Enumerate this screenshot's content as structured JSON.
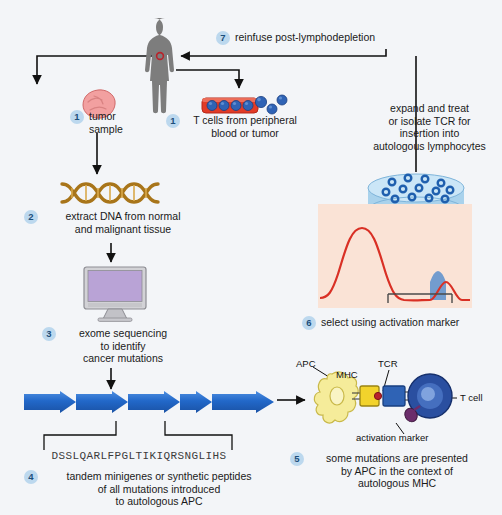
{
  "diagram": {
    "background_color": "#f3f5f8"
  },
  "palette": {
    "badge_fill": "#bcd8ee",
    "badge_text": "#1c4f7c",
    "arrow": "#111111",
    "body_silhouette": "#7d7d7d",
    "tumor": "#f2a0a0",
    "vessel_red": "#e23b26",
    "tcell_blue": "#2f63b5",
    "dna_gold": "#b8860b",
    "monitor_screen": "#b9a3d6",
    "gene_arrow": "#1f63c4",
    "facs_bg": "#fae3d6",
    "facs_curve": "#d93025",
    "facs_gate_fill": "#4f86c6",
    "apc_yellow": "#f5ec9a",
    "mhc_yellow": "#f2d32c",
    "peptide_red": "#b8232b",
    "tcr_blue": "#2f63b5",
    "tcell_sphere": "#2a4fa0",
    "activation_marker": "#6b2d6b",
    "dish_blue": "#a9d2ec"
  },
  "steps": [
    {
      "number": "1",
      "id": "tumor-sample",
      "label": "tumor\nsample"
    },
    {
      "number": "1",
      "id": "t-cells-source",
      "label": "T cells from peripheral\nblood or tumor"
    },
    {
      "number": "2",
      "id": "extract-dna",
      "label": "extract DNA from normal\nand malignant tissue"
    },
    {
      "number": "3",
      "id": "exome-sequencing",
      "label": "exome sequencing\nto identify\ncancer mutations"
    },
    {
      "number": "4",
      "id": "tandem-minigenes",
      "label": "tandem minigenes or synthetic peptides\nof all mutations introduced\nto autologous APC"
    },
    {
      "number": "5",
      "id": "mutations-presented",
      "label": "some mutations are presented\nby APC in the context of\nautologous MHC"
    },
    {
      "number": "6",
      "id": "select-activation-marker",
      "label": "select using activation marker"
    },
    {
      "number": "7",
      "id": "reinfuse",
      "label": "reinfuse post-lymphodepletion"
    }
  ],
  "annotations": {
    "expand_treat": "expand and treat\nor isolate TCR for\ninsertion into\nautologous lymphocytes",
    "peptide_sequence": "DSSLQARLFPGLTIKIQRSNGLIHS",
    "apc": "APC",
    "mhc": "MHC",
    "tcr": "TCR",
    "t_cell": "T cell",
    "activation_marker": "activation marker"
  }
}
